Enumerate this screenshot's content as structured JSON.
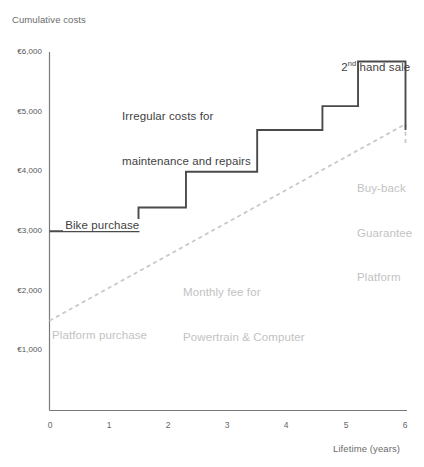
{
  "chart_data": {
    "type": "line",
    "title": "Cumulative costs",
    "xlabel": "Lifetime (years)",
    "ylabel": "Cumulative costs",
    "xlim": [
      0,
      6
    ],
    "ylim": [
      0,
      6000
    ],
    "grid": false,
    "legend": "none",
    "x_ticks": [
      "0",
      "1",
      "2",
      "3",
      "4",
      "5",
      "6"
    ],
    "x_tick_values": [
      0,
      1,
      2,
      3,
      4,
      5,
      6
    ],
    "y_ticks": [
      "€1,000",
      "€2,000",
      "€3,000",
      "€4,000",
      "€5,000",
      "€6,000"
    ],
    "y_tick_values": [
      1000,
      2000,
      3000,
      4000,
      5000,
      6000
    ],
    "series": [
      {
        "name": "Ownership (purchase + irregular maintenance and repairs)",
        "style": "step-solid",
        "color": "#4a4a4a",
        "points": [
          {
            "x": 0.0,
            "y": 3000
          },
          {
            "x": 1.5,
            "y": 3000
          },
          {
            "x": 1.5,
            "y": 3400
          },
          {
            "x": 2.3,
            "y": 3400
          },
          {
            "x": 2.3,
            "y": 4000
          },
          {
            "x": 3.5,
            "y": 4000
          },
          {
            "x": 3.5,
            "y": 4700
          },
          {
            "x": 4.6,
            "y": 4700
          },
          {
            "x": 4.6,
            "y": 5100
          },
          {
            "x": 5.2,
            "y": 5100
          },
          {
            "x": 5.2,
            "y": 5850
          },
          {
            "x": 6.0,
            "y": 5850
          },
          {
            "x": 6.0,
            "y": 4700
          }
        ]
      },
      {
        "name": "Platform (purchase + monthly fee for powertrain & computer)",
        "style": "dashed",
        "color": "#c9c9c9",
        "points": [
          {
            "x": 0.0,
            "y": 1500
          },
          {
            "x": 6.0,
            "y": 4800
          },
          {
            "x": 6.0,
            "y": 4450
          }
        ]
      }
    ],
    "annotations": [
      {
        "id": "bike-purchase",
        "text": "Bike purchase",
        "tone": "dark",
        "x": 0.1,
        "y": 3150
      },
      {
        "id": "irregular-costs",
        "text": "Irregular costs for\nmaintenance and repairs",
        "tone": "dark",
        "x": 1.3,
        "y": 5250
      },
      {
        "id": "second-hand-sale",
        "text_prefix": "2",
        "text_sup": "nd",
        "text_suffix": " hand sale",
        "tone": "dark",
        "x": 4.7,
        "y": 6050
      },
      {
        "id": "monthly-fee",
        "text": "Monthly fee for\nPowertrain & Computer",
        "tone": "grey",
        "x": 2.3,
        "y": 2500
      },
      {
        "id": "platform-purchase",
        "text": "Platform purchase",
        "tone": "grey",
        "x": 0.1,
        "y": 1280
      },
      {
        "id": "buy-back",
        "text": "Buy-back\nGuarantee\nPlatform",
        "tone": "grey",
        "x": 5.15,
        "y": 4050
      }
    ]
  },
  "labels": {
    "y_axis_title": "Cumulative costs",
    "x_axis_title": "Lifetime (years)",
    "y_tick_6000": "€6,000",
    "y_tick_5000": "€5,000",
    "y_tick_4000": "€4,000",
    "y_tick_3000": "€3,000",
    "y_tick_2000": "€2,000",
    "y_tick_1000": "€1,000",
    "x_tick_0": "0",
    "x_tick_1": "1",
    "x_tick_2": "2",
    "x_tick_3": "3",
    "x_tick_4": "4",
    "x_tick_5": "5",
    "x_tick_6": "6",
    "ann_bike_purchase": "Bike purchase",
    "ann_irregular_line1": "Irregular costs for",
    "ann_irregular_line2": "maintenance and repairs",
    "ann_second_hand_num": "2",
    "ann_second_hand_sup": "nd",
    "ann_second_hand_rest": " hand sale",
    "ann_monthly_line1": "Monthly fee for",
    "ann_monthly_line2": "Powertrain & Computer",
    "ann_platform_purchase": "Platform purchase",
    "ann_buyback_line1": "Buy-back",
    "ann_buyback_line2": "Guarantee",
    "ann_buyback_line3": "Platform"
  },
  "colors": {
    "ownership_line": "#4a4a4a",
    "platform_line": "#c9c9c9",
    "axis": "#7a7a7a",
    "text_dark": "#3f3f3f",
    "text_grey": "#c2c2c2",
    "background": "#ffffff"
  }
}
